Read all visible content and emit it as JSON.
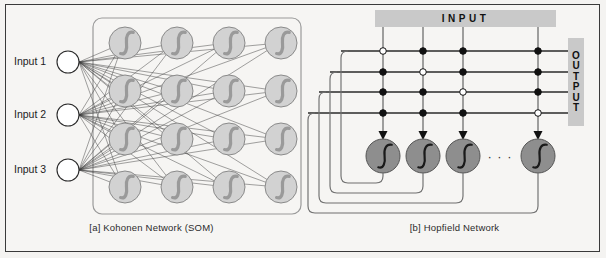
{
  "figure": {
    "background": "#f4f3f1",
    "border_color": "#3a3a3a"
  },
  "panels": [
    {
      "id": "kohonen",
      "caption": "[a] Kohonen Network (SOM)",
      "inputs": [
        {
          "label": "Input 1",
          "cx": 68,
          "cy": 62
        },
        {
          "label": "Input 2",
          "cx": 68,
          "cy": 115
        },
        {
          "label": "Input 3",
          "cx": 68,
          "cy": 170
        }
      ],
      "map_box": {
        "x": 93,
        "y": 18,
        "w": 208,
        "h": 196,
        "r": 9
      },
      "grid": {
        "cols": 4,
        "rows": 4,
        "x0": 125,
        "y0": 43,
        "dx": 52,
        "dy": 48,
        "r": 16
      },
      "colors": {
        "input_fill": "#ffffff",
        "input_stroke": "#2a2a2a",
        "neuron_fill": "#d2d2d2",
        "neuron_stroke": "#8a8a8a",
        "glyph": "#9a9a9a",
        "link": "#3a3a3a",
        "box_stroke": "#9a9a9a"
      }
    },
    {
      "id": "hopfield",
      "caption": "[b] Hopfield Network",
      "input_label": "INPUT",
      "output_label": "OUTPUT",
      "output_letters": [
        "O",
        "U",
        "T",
        "P",
        "U",
        "T"
      ],
      "columns": [
        383,
        423,
        463,
        538
      ],
      "rows": [
        51,
        72,
        92,
        113
      ],
      "neuron_y": 156,
      "neuron_r": 17,
      "ellipsis": "· · ·",
      "ellipsis_x": 500,
      "junctions": [
        [
          "open",
          "fill",
          "fill",
          "fill"
        ],
        [
          "fill",
          "open",
          "fill",
          "fill"
        ],
        [
          "fill",
          "fill",
          "open",
          "fill"
        ],
        [
          "fill",
          "fill",
          "fill",
          "open"
        ]
      ],
      "feedback_left_x": [
        341,
        330,
        319,
        308
      ],
      "feedback_bottom_y": [
        183,
        193,
        203,
        213
      ],
      "colors": {
        "wire": "#6f6f6f",
        "wire_dark": "#2a2a2a",
        "dot_fill": "#111111",
        "dot_open": "#ffffff",
        "neuron_fill": "#8e8e8e",
        "neuron_stroke": "#555555",
        "glyph": "#1a1a1a",
        "bar_bg": "#c9c9c9"
      }
    }
  ]
}
